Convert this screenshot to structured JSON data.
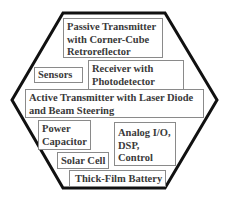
{
  "diagram": {
    "shape": "hexagon",
    "outline_color": "#111111",
    "components": [
      {
        "id": "passive",
        "lines": [
          "Passive Transmitter",
          "with Corner-Cube",
          "Retroreflector"
        ]
      },
      {
        "id": "sensors",
        "lines": [
          "Sensors"
        ]
      },
      {
        "id": "receiver",
        "lines": [
          "Receiver with",
          "Photodetector"
        ]
      },
      {
        "id": "active",
        "lines": [
          "Active Transmitter with Laser Diode",
          "and Beam Steering"
        ]
      },
      {
        "id": "power",
        "lines": [
          "Power",
          "Capacitor"
        ]
      },
      {
        "id": "analog",
        "lines": [
          "Analog I/O,",
          "DSP,",
          "Control"
        ]
      },
      {
        "id": "solar",
        "lines": [
          "Solar Cell"
        ]
      },
      {
        "id": "battery",
        "lines": [
          "Thick-Film Battery"
        ]
      }
    ]
  }
}
